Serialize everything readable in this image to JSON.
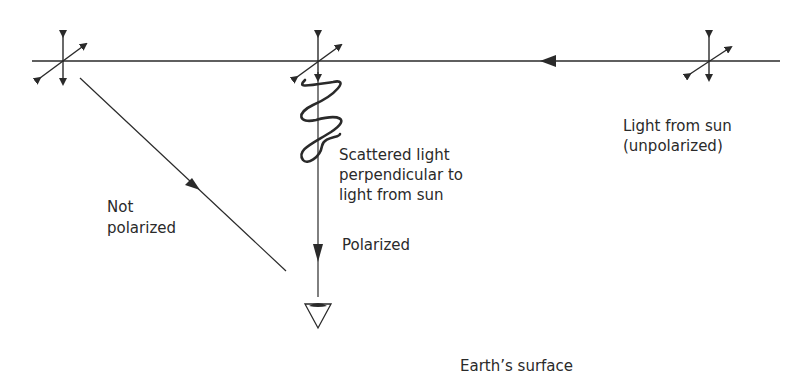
{
  "diagram": {
    "labels": {
      "sun_line1": "Light from sun",
      "sun_line2": "(unpolarized)",
      "scattered_line1": "Scattered light",
      "scattered_line2": "perpendicular to",
      "scattered_line3": "light from sun",
      "not_polarized_line1": "Not",
      "not_polarized_line2": "polarized",
      "polarized": "Polarized",
      "earth": "Earth’s surface"
    },
    "icons": {
      "unpolarized_marker": "crossed-double-arrows",
      "observer": "eye-icon"
    },
    "colors": {
      "ink": "#2a2a2a",
      "background": "#ffffff"
    }
  }
}
